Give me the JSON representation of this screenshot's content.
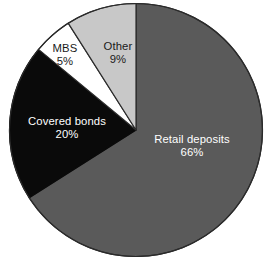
{
  "chart_data": {
    "type": "pie",
    "title": "",
    "subtitle": "",
    "xlabel": "",
    "ylabel": "",
    "legend": "none",
    "grid": false,
    "units": "percent",
    "start_angle_deg": 0,
    "direction": "clockwise",
    "categories": [
      "Retail deposits",
      "Covered bonds",
      "MBS",
      "Other"
    ],
    "values": [
      66,
      20,
      5,
      9
    ],
    "slices": [
      {
        "label": "Retail deposits",
        "value": 66,
        "value_text": "66%",
        "color": "#5a5a5a",
        "label_color": "#ffffff",
        "outline": "#2b2b2b"
      },
      {
        "label": "Covered bonds",
        "value": 20,
        "value_text": "20%",
        "color": "#0a0a0a",
        "label_color": "#ffffff",
        "outline": "#0a0a0a"
      },
      {
        "label": "MBS",
        "value": 5,
        "value_text": "5%",
        "color": "#ffffff",
        "label_color": "#1a1a1a",
        "outline": "#2b2b2b"
      },
      {
        "label": "Other",
        "value": 9,
        "value_text": "9%",
        "color": "#c8c8c8",
        "label_color": "#1a1a1a",
        "outline": "#2b2b2b"
      }
    ],
    "background": "#ffffff"
  }
}
